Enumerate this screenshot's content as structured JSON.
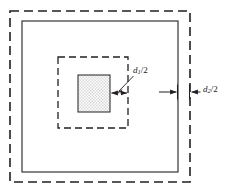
{
  "figure": {
    "type": "technical-diagram",
    "background_color": "#ffffff",
    "line_color": "#231f20",
    "fill_color": "#e9e9e9",
    "shapes": [
      {
        "name": "outer-dashed-square",
        "style": "dashed",
        "x": 10,
        "y": 11,
        "width": 180,
        "height": 171
      },
      {
        "name": "outer-solid-square",
        "style": "solid",
        "x": 22,
        "y": 21,
        "width": 156,
        "height": 151
      },
      {
        "name": "inner-dashed-square",
        "style": "dashed",
        "x": 58,
        "y": 57,
        "width": 70,
        "height": 71
      },
      {
        "name": "inner-filled-square",
        "style": "solid-filled",
        "x": 78,
        "y": 75,
        "width": 32,
        "height": 37
      }
    ],
    "dimensions": [
      {
        "name": "d1-half",
        "label": "d",
        "subscript": "1",
        "divisor": "/2",
        "full_text": "d1/2",
        "arrow_left_x": 110,
        "arrow_right_x": 128,
        "arrow_y": 93,
        "leader_from_x": 133,
        "leader_from_y": 74,
        "leader_to_x": 117,
        "leader_to_y": 90
      },
      {
        "name": "d2-half",
        "label": "d",
        "subscript": "2",
        "divisor": "/2",
        "full_text": "d2/2",
        "arrow_left_x": 160,
        "arrow_right_x": 178,
        "arrow_y": 92,
        "leader_from_x": 201,
        "leader_from_y": 92,
        "leader_to_x": 190,
        "leader_to_y": 92
      }
    ]
  },
  "labels": {
    "d1": {
      "d": "d",
      "sub": "1",
      "rest": "/2"
    },
    "d2": {
      "d": "d",
      "sub": "2",
      "rest": "/2"
    }
  }
}
